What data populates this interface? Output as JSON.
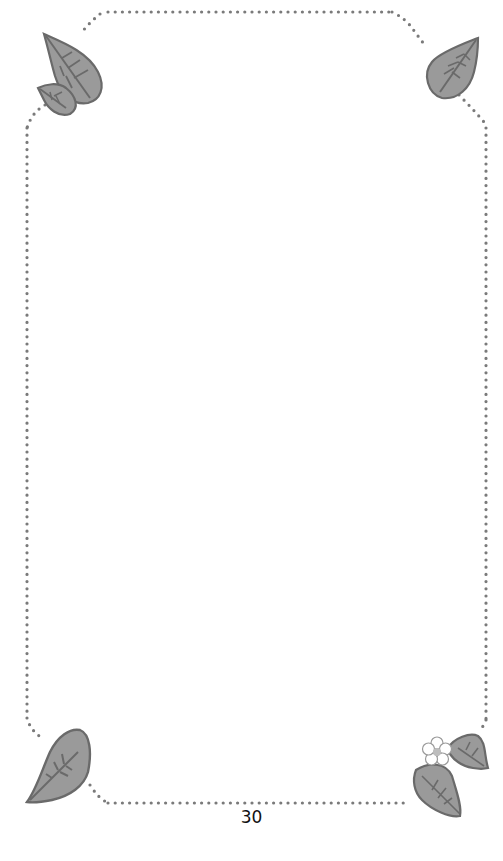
{
  "page": {
    "page_number": "30",
    "border_style": "dotted-frame-with-leaf-corners",
    "colors": {
      "dots": "#7a7a7a",
      "leaf_fill": "#9a9a9a",
      "leaf_outline": "#6a6a6a",
      "flower": "#ffffff"
    },
    "decorations": [
      {
        "position": "top-left",
        "icon": "two-leaves-icon"
      },
      {
        "position": "top-right",
        "icon": "leaf-icon"
      },
      {
        "position": "bottom-left",
        "icon": "leaf-icon"
      },
      {
        "position": "bottom-right",
        "icon": "leaves-with-flower-icon"
      }
    ]
  }
}
